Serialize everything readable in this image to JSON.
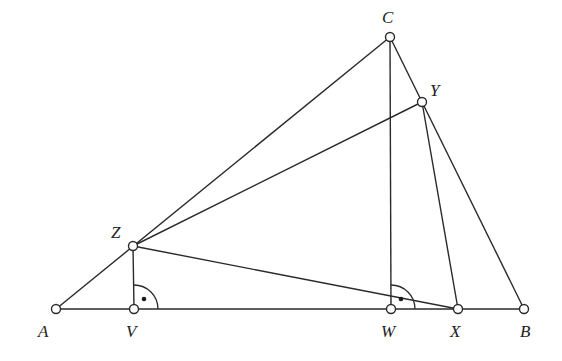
{
  "diagram": {
    "points": [
      {
        "id": "A",
        "label": "A"
      },
      {
        "id": "B",
        "label": "B"
      },
      {
        "id": "C",
        "label": "C"
      },
      {
        "id": "X",
        "label": "X"
      },
      {
        "id": "Y",
        "label": "Y"
      },
      {
        "id": "Z",
        "label": "Z"
      },
      {
        "id": "V",
        "label": "V"
      },
      {
        "id": "W",
        "label": "W"
      }
    ],
    "segments": [
      [
        "A",
        "B"
      ],
      [
        "A",
        "C"
      ],
      [
        "C",
        "B"
      ],
      [
        "C",
        "W"
      ],
      [
        "Z",
        "Y"
      ],
      [
        "Z",
        "X"
      ],
      [
        "Z",
        "V"
      ],
      [
        "Y",
        "X"
      ]
    ],
    "right_angle_marks": [
      {
        "vertex": "V",
        "between": [
          "Z",
          "B"
        ]
      },
      {
        "vertex": "W",
        "between": [
          "C",
          "B"
        ]
      }
    ]
  }
}
